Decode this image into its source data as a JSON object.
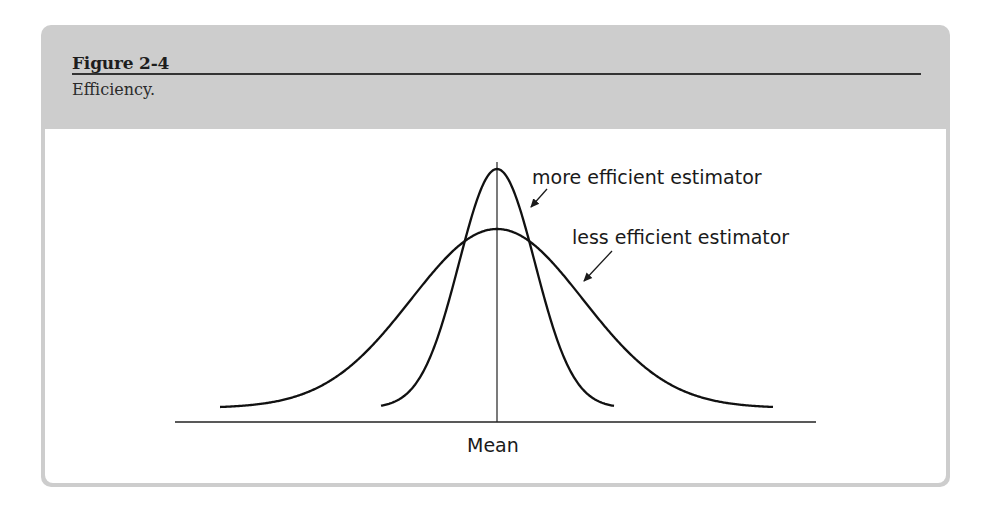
{
  "figure": {
    "title": "Figure 2-4",
    "caption": "Efficiency."
  },
  "chart_data": {
    "type": "line",
    "title": "Efficiency.",
    "xlabel": "Mean",
    "ylabel": "",
    "grid": false,
    "legend": "none (inline annotations with arrows)",
    "series": [
      {
        "name": "more efficient estimator",
        "shape": "normal",
        "center": 0,
        "relative_sd": 0.44,
        "relative_peak_height": 1.0
      },
      {
        "name": "less efficient estimator",
        "shape": "normal",
        "center": 0,
        "relative_sd": 1.0,
        "relative_peak_height": 0.75
      }
    ],
    "annotations": [
      {
        "text": "more efficient estimator",
        "points_to": "more efficient estimator curve (right flank)"
      },
      {
        "text": "less efficient estimator",
        "points_to": "less efficient estimator curve (right flank)"
      }
    ],
    "reference_line": {
      "x": "Mean",
      "orientation": "vertical"
    }
  },
  "labels": {
    "more": "more efficient estimator",
    "less": "less efficient estimator",
    "axis": "Mean"
  }
}
